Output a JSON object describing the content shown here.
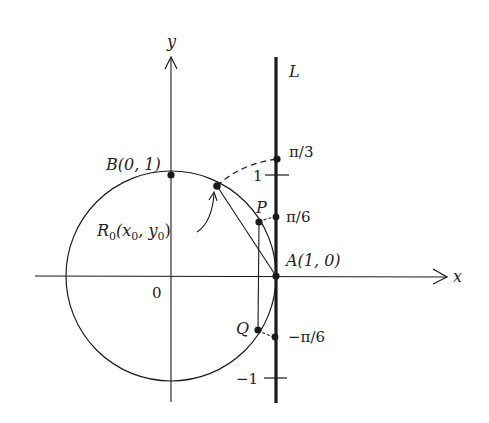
{
  "figure": {
    "colors": {
      "ink": "#1a1a1a",
      "background": "#ffffff"
    },
    "axes": {
      "x_label": "x",
      "y_label": "y",
      "origin_label": "0"
    },
    "line": {
      "label": "L"
    },
    "points": {
      "A": {
        "label": "A(1, 0)"
      },
      "B": {
        "label": "B(0, 1)"
      },
      "R0": {
        "label_main": "R",
        "label_sub": "0",
        "label_rest_open": "(x",
        "label_sub_x": "0",
        "label_comma": ", y",
        "label_sub_y": "0",
        "label_close": ")"
      },
      "P": {
        "label": "P"
      },
      "Q": {
        "label": "Q"
      }
    },
    "line_marks": {
      "pi_over_3": "π/3",
      "pi_over_6": "π/6",
      "neg_pi_over_6": "−π/6",
      "one": "1",
      "neg_one": "−1"
    }
  }
}
